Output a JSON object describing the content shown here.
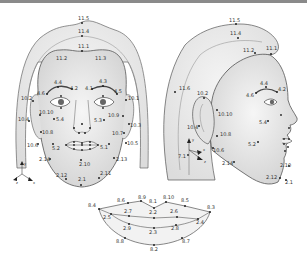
{
  "figure": {
    "colors": {
      "outline": "#555555",
      "skin_fill": "#e4e4e4",
      "hair_fill": "#ececec",
      "point": "#222222",
      "label": "#333333",
      "frame": "#8a8a8a"
    }
  },
  "frontal_view": {
    "labels": {
      "p11_5": "11.5",
      "p11_4": "11.4",
      "p11_1": "11.1",
      "p11_2": "11.2",
      "p11_3": "11.3",
      "p4_4": "4.4",
      "p4_2": "4.2",
      "p4_1": "4.1",
      "p4_3": "4.3",
      "p4_6": "4.6",
      "p4_5": "4.5",
      "p10_2": "10.2",
      "p10_1": "10.1",
      "p10_10": "10.10",
      "p10_9": "10.9",
      "p10_4": "10.4",
      "p10_3": "10.3",
      "p10_8": "10.8",
      "p10_7": "10.7",
      "p10_6": "10.6",
      "p10_5": "10.5",
      "p5_4": "5.4",
      "p5_3": "5.3",
      "p5_2": "5.2",
      "p5_1": "5.1",
      "p2_14": "2.14",
      "p2_13": "2.13",
      "p2_10": "2.10",
      "p2_12": "2.12",
      "p2_11": "2.11",
      "p2_1": "2.1"
    },
    "axes": {
      "y": "y",
      "x": "x",
      "z": "z"
    }
  },
  "profile_view": {
    "labels": {
      "p11_5": "11.5",
      "p11_4": "11.4",
      "p11_2": "11.2",
      "p11_1": "11.1",
      "p11_6": "11.6",
      "p10_2": "10.2",
      "p10_10": "10.10",
      "p4_4": "4.4",
      "p4_2": "4.2",
      "p4_6": "4.6",
      "p10_4": "10.4",
      "p5_4": "5.4",
      "p10_8": "10.8",
      "p10_6": "10.6",
      "p7_1": "7.1",
      "p5_2": "5.2",
      "p2_14": "2.14",
      "p2_10": "2.10",
      "p2_12": "2.12",
      "p2_1": "2.1"
    },
    "axes": {
      "y": "y",
      "x": "x",
      "z": "z"
    }
  },
  "mouth_detail": {
    "labels": {
      "p8_4": "8.4",
      "p8_6": "8.6",
      "p8_9": "8.9",
      "p8_1": "8.1",
      "p8_10": "8.10",
      "p8_5": "8.5",
      "p8_3": "8.3",
      "p2_7": "2.7",
      "p2_2": "2.2",
      "p2_6": "2.6",
      "p2_5": "2.5",
      "p2_4": "2.4",
      "p2_9": "2.9",
      "p2_3": "2.3",
      "p2_8": "2.8",
      "p8_8": "8.8",
      "p8_2": "8.2",
      "p8_7": "8.7"
    }
  }
}
